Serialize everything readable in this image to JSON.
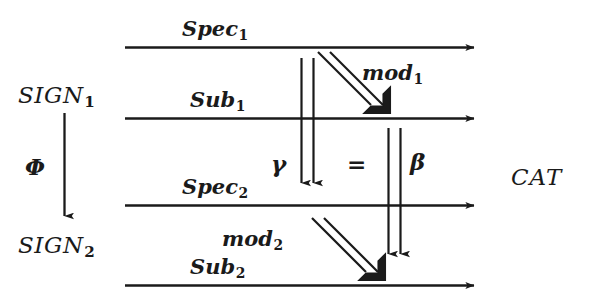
{
  "diagram": {
    "type": "commutative-diagram",
    "background_color": "#ffffff",
    "ink_color": "#1a1a1a",
    "category_label": "CAT",
    "source_objects": [
      {
        "base": "SIGN",
        "sub": "1"
      },
      {
        "base": "SIGN",
        "sub": "2"
      }
    ],
    "vertical_functor": {
      "base": "Φ",
      "sub": ""
    },
    "horizontal_arrows": [
      {
        "base": "Spec",
        "sub": "1"
      },
      {
        "base": "Sub",
        "sub": "1"
      },
      {
        "base": "Spec",
        "sub": "2"
      },
      {
        "base": "Sub",
        "sub": "2"
      }
    ],
    "diagonal_arrows": [
      {
        "base": "mod",
        "sub": "1"
      },
      {
        "base": "mod",
        "sub": "2"
      }
    ],
    "natural_transformations": [
      {
        "base": "γ",
        "sub": ""
      },
      {
        "base": "β",
        "sub": ""
      }
    ],
    "equality_sign": "=",
    "labels": {
      "sign1": "SIGN",
      "sign1_sub": "1",
      "sign2": "SIGN",
      "sign2_sub": "2",
      "phi": "Φ",
      "spec1": "Spec",
      "spec1_sub": "1",
      "sub1": "Sub",
      "sub1_sub": "1",
      "spec2": "Spec",
      "spec2_sub": "2",
      "sub2": "Sub",
      "sub2_sub": "2",
      "mod1": "mod",
      "mod1_sub": "1",
      "mod2": "mod",
      "mod2_sub": "2",
      "gamma": "γ",
      "beta": "β",
      "equals": "=",
      "cat": "CAT"
    }
  }
}
